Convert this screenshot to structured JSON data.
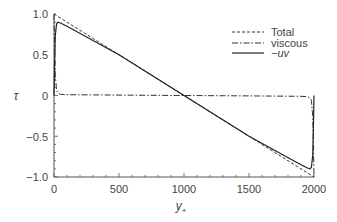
{
  "chart_data": {
    "type": "line",
    "title": "",
    "xlabel": "y+",
    "xlabel_main": "y",
    "xlabel_sub": "+",
    "ylabel": "τ",
    "xlim": [
      0,
      2000
    ],
    "ylim": [
      -1.0,
      1.0
    ],
    "x_ticks": [
      "0",
      "500",
      "1000",
      "1500",
      "2000"
    ],
    "y_ticks": [
      "1.0",
      "0.5",
      "0",
      "−0.5",
      "−1.0"
    ],
    "grid": false,
    "legend_position": "upper right",
    "legend": [
      "Total",
      "viscous",
      "−uv"
    ],
    "series": [
      {
        "name": "Total",
        "style": "dashed",
        "x": [
          0,
          1000,
          2000
        ],
        "y": [
          1.0,
          0.0,
          -1.0
        ]
      },
      {
        "name": "viscous",
        "style": "dashdot",
        "x": [
          0,
          5,
          10,
          20,
          30,
          50,
          100,
          500,
          1000,
          1500,
          1900,
          1950,
          1970,
          1980,
          1990,
          1995,
          2000
        ],
        "y": [
          1.0,
          0.6,
          0.25,
          0.06,
          0.03,
          0.015,
          0.01,
          0.005,
          0.0,
          -0.005,
          -0.01,
          -0.015,
          -0.03,
          -0.06,
          -0.25,
          -0.6,
          -1.0
        ]
      },
      {
        "name": "−uv",
        "style": "solid",
        "x": [
          0,
          5,
          10,
          20,
          30,
          50,
          100,
          500,
          1000,
          1500,
          1900,
          1950,
          1970,
          1980,
          1990,
          1995,
          2000
        ],
        "y": [
          0.0,
          0.4,
          0.74,
          0.88,
          0.9,
          0.89,
          0.85,
          0.5,
          0.0,
          -0.5,
          -0.85,
          -0.89,
          -0.9,
          -0.88,
          -0.74,
          -0.4,
          0.0
        ]
      }
    ]
  },
  "legend": {
    "total": "Total",
    "viscous": "viscous",
    "uv": "−uv"
  },
  "axes": {
    "ylabel": "τ",
    "xlabel_main": "y",
    "xlabel_sub": "+",
    "x_ticks": [
      "0",
      "500",
      "1000",
      "1500",
      "2000"
    ],
    "y_ticks": [
      "1.0",
      "0.5",
      "0",
      "−0.5",
      "−1.0"
    ]
  }
}
